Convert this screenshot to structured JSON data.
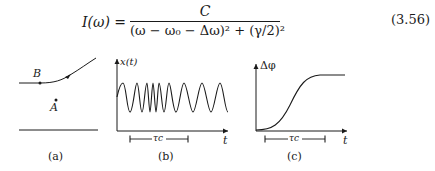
{
  "equation": {
    "lhs": "I(ω) =",
    "numerator": "C",
    "denominator": "(ω − ω₀ − Δω)² + (γ/2)²",
    "number": "(3.56)"
  },
  "figure": {
    "panels": [
      {
        "id": "a",
        "caption": "(a)",
        "labels": {
          "point_b": "B",
          "point_a": "A"
        }
      },
      {
        "id": "b",
        "caption": "(b)",
        "y_axis_label": "x(t)",
        "x_axis_label": "t",
        "bracket_label": "τc"
      },
      {
        "id": "c",
        "caption": "(c)",
        "y_axis_label": "Δφ",
        "x_axis_label": "t",
        "bracket_label": "τc"
      }
    ]
  }
}
